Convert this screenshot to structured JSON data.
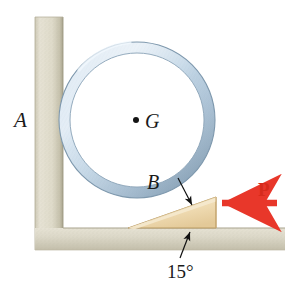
{
  "figure": {
    "labels": {
      "wall_label": "A",
      "center_label": "G",
      "contact_label": "B",
      "force_label": "P",
      "angle_label": "15°"
    },
    "colors": {
      "ring_light": "#dce8f2",
      "ring_mid": "#b9cfe0",
      "ring_dark": "#8fa9bd",
      "ring_outline": "#7e98ad",
      "wall_light": "#e4e0d2",
      "wall_mid": "#d6d2c1",
      "wall_dark": "#b9b4a0",
      "floor_light": "#e2ded0",
      "floor_dark": "#c5c0ad",
      "wedge_light": "#f7e9cc",
      "wedge_mid": "#edd9ae",
      "wedge_dark": "#d9bd86",
      "wedge_outline": "#b99a63",
      "force_arrow": "#e8372a",
      "leader_line": "#111111",
      "text": "#1a1a1a",
      "background": "#ffffff"
    },
    "geometry": {
      "ring_center_x": 137,
      "ring_center_y": 120,
      "ring_outer_radius": 78,
      "ring_inner_radius": 67,
      "wall_left": 35,
      "wall_right": 63,
      "wall_top": 17,
      "floor_top": 228,
      "floor_bottom": 250,
      "floor_right": 285,
      "wedge_tip_x": 128,
      "wedge_right_x": 216,
      "wedge_top_y": 197,
      "wedge_base_y": 228,
      "incline_degrees": 15,
      "force_arrow_y": 203,
      "force_arrow_tail_x": 277,
      "force_arrow_head_x": 219
    },
    "icons": {
      "force_arrow": "left-arrow-icon",
      "contact_leader": "leader-arrow-icon",
      "angle_leader": "leader-arrow-icon",
      "center_marker": "dot-icon"
    }
  }
}
